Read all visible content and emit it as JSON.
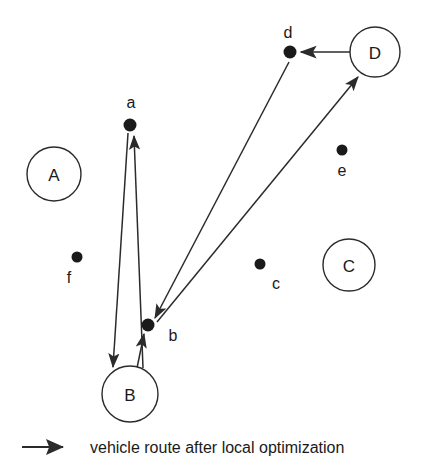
{
  "figure": {
    "type": "vehicle-routing-diagram",
    "background_color": "#ffffff",
    "line_color": "#2b2b2b",
    "node_fill": "#1a1a1a",
    "depot_stroke": "#2b2b2b"
  },
  "depots": [
    {
      "id": "A",
      "label": "A",
      "cx": 54,
      "cy": 174,
      "r": 27
    },
    {
      "id": "B",
      "label": "B",
      "cx": 130,
      "cy": 394,
      "r": 28
    },
    {
      "id": "C",
      "label": "C",
      "cx": 349,
      "cy": 265,
      "r": 26
    },
    {
      "id": "D",
      "label": "D",
      "cx": 375,
      "cy": 52,
      "r": 25
    }
  ],
  "customers": [
    {
      "id": "a",
      "label": "a",
      "cx": 130,
      "cy": 125,
      "r": 6.5,
      "label_x": 131,
      "label_y": 108
    },
    {
      "id": "b",
      "label": "b",
      "cx": 148,
      "cy": 325,
      "r": 6.5,
      "label_x": 173,
      "label_y": 341
    },
    {
      "id": "c",
      "label": "c",
      "cx": 260,
      "cy": 264,
      "r": 5.5,
      "label_x": 276,
      "label_y": 289
    },
    {
      "id": "d",
      "label": "d",
      "cx": 290,
      "cy": 52,
      "r": 6.5,
      "label_x": 288,
      "label_y": 38
    },
    {
      "id": "e",
      "label": "e",
      "cx": 342,
      "cy": 150,
      "r": 5.5,
      "label_x": 342,
      "label_y": 176
    },
    {
      "id": "f",
      "label": "f",
      "cx": 77,
      "cy": 257,
      "r": 5.5,
      "label_x": 69,
      "label_y": 283
    }
  ],
  "routes": [
    {
      "from": "a",
      "to": "B",
      "x1": 128,
      "y1": 133,
      "x2": 113,
      "y2": 367,
      "arrow": "end"
    },
    {
      "from": "B",
      "to": "a",
      "x1": 143,
      "y1": 368,
      "x2": 134,
      "y2": 136,
      "arrow": "end"
    },
    {
      "from": "B",
      "to": "b",
      "x1": 137,
      "y1": 368,
      "x2": 144,
      "y2": 334,
      "arrow": "end"
    },
    {
      "from": "d",
      "to": "b",
      "x1": 289,
      "y1": 62,
      "x2": 155,
      "y2": 318,
      "arrow": "end"
    },
    {
      "from": "b",
      "to": "D",
      "x1": 157,
      "y1": 322,
      "x2": 358,
      "y2": 77,
      "arrow": "end"
    },
    {
      "from": "D",
      "to": "d",
      "x1": 350,
      "y1": 52,
      "x2": 301,
      "y2": 52,
      "arrow": "end"
    }
  ],
  "legend": {
    "arrow_label": "arrow-sample",
    "text": "vehicle route after local optimization",
    "arrow_x1": 22,
    "arrow_x2": 63,
    "arrow_y": 447,
    "text_x": 90,
    "text_y": 453
  }
}
